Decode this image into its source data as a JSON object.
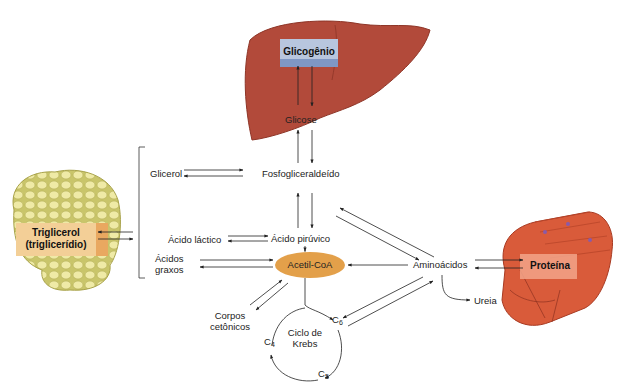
{
  "organs": {
    "liver": {
      "name": "liver",
      "store_label": "Glicogênio",
      "color": "#b24a3a",
      "box_color": "#b8c6de"
    },
    "adipose": {
      "name": "adipose-tissue",
      "store_label_line1": "Triglicerol",
      "store_label_line2": "(triglicerídio)",
      "color": "#e7e29a",
      "box_color": "#f3cf97"
    },
    "muscle": {
      "name": "muscle",
      "store_label": "Proteína",
      "color": "#d95b3a",
      "box_color": "#f2a58a"
    }
  },
  "metabolites": {
    "glicose": "Glicose",
    "fosfogliceraldeido": "Fosfogliceraldeído",
    "glicerol": "Glicerol",
    "acido_latico": "Ácido láctico",
    "acido_piruvico": "Ácido pirúvico",
    "acidos_graxos_line1": "Ácidos",
    "acidos_graxos_line2": "graxos",
    "acetil_coa": "Acetil-CoA",
    "aminoacidos": "Aminoácidos",
    "ureia": "Ureia",
    "corpos_line1": "Corpos",
    "corpos_line2": "cetônicos",
    "krebs_line1": "Ciclo de",
    "krebs_line2": "Krebs"
  },
  "krebs_intermediates": {
    "c6": {
      "base": "C",
      "sub": "6"
    },
    "c5": {
      "base": "C",
      "sub": "5"
    },
    "c4": {
      "base": "C",
      "sub": "4"
    }
  },
  "colors": {
    "acetil_coa_fill": "#e3a04a",
    "arrow": "#222222"
  }
}
